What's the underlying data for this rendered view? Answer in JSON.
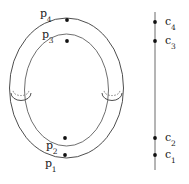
{
  "figure": {
    "kind": "mathematical-diagram",
    "background_color": "#ffffff",
    "stroke_color": "#3a3a3a",
    "dot_color": "#111111"
  },
  "surface": {
    "name": "genus-two-surface-outline",
    "outer_oval": {
      "cx": 66.5,
      "cy": 88,
      "rx": 57,
      "ry": 70
    },
    "inner_oval": {
      "cx": 66.5,
      "cy": 90,
      "rx": 42,
      "ry": 56
    },
    "handles": [
      {
        "name": "left-handle",
        "cx": 21,
        "cy": 93,
        "rx": 10,
        "ry": 7.5
      },
      {
        "name": "right-handle",
        "cx": 112,
        "cy": 93,
        "rx": 10,
        "ry": 7.5
      }
    ],
    "points": [
      {
        "id": "p4",
        "label": "p",
        "sub": "4",
        "x": 67,
        "y": 20,
        "label_x": 40,
        "label_y": 8
      },
      {
        "id": "p3",
        "label": "p",
        "sub": "3",
        "x": 67,
        "y": 41,
        "label_x": 42,
        "label_y": 29
      },
      {
        "id": "p2",
        "label": "p",
        "sub": "2",
        "x": 65,
        "y": 138,
        "label_x": 46,
        "label_y": 140
      },
      {
        "id": "p1",
        "label": "p",
        "sub": "1",
        "x": 65,
        "y": 155,
        "label_x": 45,
        "label_y": 158
      }
    ]
  },
  "axis": {
    "name": "critical-value-line",
    "x": 155,
    "y_top": 12,
    "y_bottom": 170,
    "points": [
      {
        "id": "c4",
        "label": "c",
        "sub": "4",
        "x": 155,
        "y": 22,
        "label_x": 165,
        "label_y": 16
      },
      {
        "id": "c3",
        "label": "c",
        "sub": "3",
        "x": 155,
        "y": 41,
        "label_x": 165,
        "label_y": 35
      },
      {
        "id": "c2",
        "label": "c",
        "sub": "2",
        "x": 155,
        "y": 138,
        "label_x": 165,
        "label_y": 132
      },
      {
        "id": "c1",
        "label": "c",
        "sub": "1",
        "x": 155,
        "y": 155,
        "label_x": 165,
        "label_y": 149
      }
    ]
  }
}
